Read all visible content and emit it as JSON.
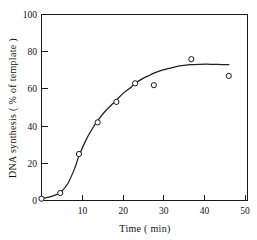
{
  "chart_data": {
    "type": "scatter",
    "title": "",
    "xlabel": "Time ( min)",
    "ylabel": "DNA synthesis ( % of template )",
    "xlim": [
      0,
      55
    ],
    "ylim": [
      0,
      100
    ],
    "grid": false,
    "legend": "none",
    "marker_style": "open-circle",
    "xticks": [
      10,
      20,
      30,
      40,
      50
    ],
    "xtick_labels": [
      "10",
      "20",
      "30",
      "40",
      "50"
    ],
    "yticks": [
      0,
      20,
      40,
      60,
      80,
      100
    ],
    "ytick_labels": [
      "0",
      "20",
      "40",
      "60",
      "80",
      "100"
    ],
    "x": [
      0,
      5,
      10,
      15,
      20,
      25,
      30,
      40,
      50
    ],
    "values": [
      1,
      4,
      25,
      42,
      53,
      63,
      62,
      76,
      67
    ],
    "series": [
      {
        "name": "DNA synthesis",
        "x": [
          0,
          5,
          10,
          15,
          20,
          25,
          30,
          40,
          50
        ],
        "values": [
          1,
          4,
          25,
          42,
          53,
          63,
          62,
          76,
          67
        ]
      }
    ],
    "fit_curve": {
      "name": "fitted sigmoid",
      "x": [
        0,
        2,
        4,
        5,
        7,
        9,
        10,
        12,
        14,
        15,
        17,
        19,
        20,
        22,
        24,
        25,
        27,
        29,
        30,
        32,
        34,
        36,
        38,
        40,
        42,
        44,
        46,
        48,
        50
      ],
      "values": [
        1,
        1.8,
        3.2,
        4.2,
        9,
        18,
        24,
        33,
        40,
        43,
        48,
        52,
        54,
        58,
        61,
        63,
        65.5,
        67.5,
        68.5,
        70,
        71,
        72,
        72.6,
        73,
        73.2,
        73.3,
        73.2,
        73.1,
        73
      ]
    },
    "colors": {
      "axis": "#1a1a1a",
      "curve": "#1f1f1f",
      "marker_stroke": "#1a1a1a",
      "marker_fill": "#ffffff",
      "background": "#ffffff"
    }
  }
}
